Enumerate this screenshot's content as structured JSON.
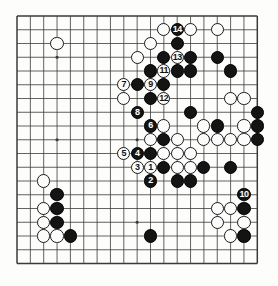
{
  "diagram": {
    "type": "go-board-diagram",
    "board_size": 19,
    "title": "",
    "colors": {
      "board_background": "#fdfdfb",
      "grid_line": "#3a3a3a",
      "black_stone": "#141414",
      "white_stone": "#fcfcfc",
      "black_label_text": "#ffffff",
      "white_label_text": "#111111"
    },
    "geometry": {
      "origin_x": 17,
      "origin_y": 16,
      "step_x": 13.35,
      "step_y": 13.75,
      "stone_radius": 6.6
    },
    "star_points": [
      {
        "col": 4,
        "row": 4
      },
      {
        "col": 10,
        "row": 4
      },
      {
        "col": 16,
        "row": 4
      },
      {
        "col": 4,
        "row": 10
      },
      {
        "col": 10,
        "row": 10
      },
      {
        "col": 16,
        "row": 10
      },
      {
        "col": 4,
        "row": 16
      },
      {
        "col": 10,
        "row": 16
      },
      {
        "col": 16,
        "row": 16
      }
    ],
    "numbered_moves": [
      {
        "n": "1",
        "color": "white",
        "col": 11,
        "row": 12
      },
      {
        "n": "2",
        "color": "black",
        "col": 11,
        "row": 13
      },
      {
        "n": "3",
        "color": "white",
        "col": 10,
        "row": 12
      },
      {
        "n": "4",
        "color": "black",
        "col": 10,
        "row": 11
      },
      {
        "n": "5",
        "color": "white",
        "col": 9,
        "row": 11
      },
      {
        "n": "6",
        "color": "black",
        "col": 11,
        "row": 9
      },
      {
        "n": "7",
        "color": "white",
        "col": 9,
        "row": 6
      },
      {
        "n": "8",
        "color": "black",
        "col": 10,
        "row": 8
      },
      {
        "n": "9",
        "color": "white",
        "col": 11,
        "row": 6
      },
      {
        "n": "10",
        "color": "black",
        "col": 18,
        "row": 14
      },
      {
        "n": "11",
        "color": "white",
        "col": 12,
        "row": 5
      },
      {
        "n": "12",
        "color": "white",
        "col": 12,
        "row": 7
      },
      {
        "n": "13",
        "color": "white",
        "col": 13,
        "row": 4
      },
      {
        "n": "14",
        "color": "black",
        "col": 13,
        "row": 2
      }
    ],
    "black_stones": [
      {
        "col": 13,
        "row": 3
      },
      {
        "col": 12,
        "row": 4
      },
      {
        "col": 14,
        "row": 4
      },
      {
        "col": 11,
        "row": 5
      },
      {
        "col": 13,
        "row": 5
      },
      {
        "col": 14,
        "row": 5
      },
      {
        "col": 16,
        "row": 4
      },
      {
        "col": 17,
        "row": 5
      },
      {
        "col": 10,
        "row": 6
      },
      {
        "col": 12,
        "row": 6
      },
      {
        "col": 11,
        "row": 7
      },
      {
        "col": 14,
        "row": 8
      },
      {
        "col": 19,
        "row": 8
      },
      {
        "col": 16,
        "row": 9
      },
      {
        "col": 19,
        "row": 9
      },
      {
        "col": 19,
        "row": 10
      },
      {
        "col": 12,
        "row": 10
      },
      {
        "col": 11,
        "row": 11
      },
      {
        "col": 12,
        "row": 12
      },
      {
        "col": 15,
        "row": 12
      },
      {
        "col": 17,
        "row": 12
      },
      {
        "col": 13,
        "row": 13
      },
      {
        "col": 14,
        "row": 13
      },
      {
        "col": 18,
        "row": 15
      },
      {
        "col": 18,
        "row": 17
      },
      {
        "col": 4,
        "row": 14
      },
      {
        "col": 4,
        "row": 15
      },
      {
        "col": 4,
        "row": 16
      },
      {
        "col": 5,
        "row": 17
      },
      {
        "col": 11,
        "row": 17
      }
    ],
    "white_stones": [
      {
        "col": 4,
        "row": 3
      },
      {
        "col": 12,
        "row": 2
      },
      {
        "col": 14,
        "row": 2
      },
      {
        "col": 11,
        "row": 3
      },
      {
        "col": 16,
        "row": 2
      },
      {
        "col": 10,
        "row": 4
      },
      {
        "col": 9,
        "row": 7
      },
      {
        "col": 17,
        "row": 7
      },
      {
        "col": 18,
        "row": 7
      },
      {
        "col": 15,
        "row": 9
      },
      {
        "col": 18,
        "row": 9
      },
      {
        "col": 15,
        "row": 10
      },
      {
        "col": 16,
        "row": 10
      },
      {
        "col": 17,
        "row": 10
      },
      {
        "col": 18,
        "row": 10
      },
      {
        "col": 12,
        "row": 11
      },
      {
        "col": 13,
        "row": 11
      },
      {
        "col": 14,
        "row": 11
      },
      {
        "col": 11,
        "row": 10
      },
      {
        "col": 13,
        "row": 10
      },
      {
        "col": 12,
        "row": 9
      },
      {
        "col": 13,
        "row": 12
      },
      {
        "col": 14,
        "row": 12
      },
      {
        "col": 16,
        "row": 15
      },
      {
        "col": 17,
        "row": 15
      },
      {
        "col": 16,
        "row": 16
      },
      {
        "col": 18,
        "row": 16
      },
      {
        "col": 17,
        "row": 17
      },
      {
        "col": 3,
        "row": 13
      },
      {
        "col": 3,
        "row": 15
      },
      {
        "col": 3,
        "row": 16
      },
      {
        "col": 3,
        "row": 17
      },
      {
        "col": 4,
        "row": 17
      }
    ]
  }
}
